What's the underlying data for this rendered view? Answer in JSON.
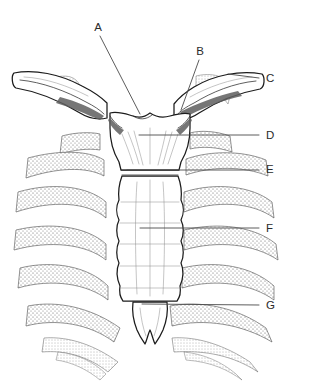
{
  "figure": {
    "style": "black ink line drawing with stippled shading on white background",
    "background_color": "#ffffff",
    "ink_color": "#1c1c1c",
    "leader_line_color": "#4a4a4a",
    "label_color": "#2b2b2b"
  },
  "labels": [
    {
      "id": "A",
      "text": "A",
      "label_x": 98,
      "label_y": 28,
      "leader_from_x": 100,
      "leader_from_y": 36,
      "leader_to_x": 140,
      "leader_to_y": 114,
      "points_to": "jugular-notch"
    },
    {
      "id": "B",
      "text": "B",
      "label_x": 200,
      "label_y": 52,
      "leader_from_x": 199,
      "leader_from_y": 60,
      "leader_to_x": 181,
      "leader_to_y": 110,
      "points_to": "clavicular-notch"
    },
    {
      "id": "C",
      "text": "C",
      "label_x": 264,
      "label_y": 79,
      "leader_from_x": 259,
      "leader_from_y": 78,
      "leader_to_x": 228,
      "leader_to_y": 74,
      "points_to": "clavicle"
    },
    {
      "id": "D",
      "text": "D",
      "label_x": 264,
      "label_y": 136,
      "leader_from_x": 259,
      "leader_from_y": 135,
      "leader_to_x": 139,
      "leader_to_y": 135,
      "points_to": "manubrium"
    },
    {
      "id": "E",
      "text": "E",
      "label_x": 264,
      "label_y": 170,
      "leader_from_x": 259,
      "leader_from_y": 170,
      "leader_to_x": 127,
      "leader_to_y": 170,
      "points_to": "sternal-angle"
    },
    {
      "id": "F",
      "text": "F",
      "label_x": 264,
      "label_y": 229,
      "leader_from_x": 259,
      "leader_from_y": 228,
      "leader_to_x": 140,
      "leader_to_y": 228,
      "points_to": "body-of-sternum"
    },
    {
      "id": "G",
      "text": "G",
      "label_x": 264,
      "label_y": 306,
      "leader_from_x": 259,
      "leader_from_y": 305,
      "leader_to_x": 142,
      "leader_to_y": 304,
      "points_to": "xiphoid-process"
    }
  ],
  "structures": {
    "manubrium": "manubrium-of-sternum",
    "body": "body-of-sternum",
    "xiphoid": "xiphoid-process",
    "clavicle_left": "left-clavicle",
    "clavicle_right": "right-clavicle",
    "first_rib_left": "left-first-rib",
    "first_rib_right": "right-first-rib",
    "costal_cartilages": "costal-cartilages"
  }
}
